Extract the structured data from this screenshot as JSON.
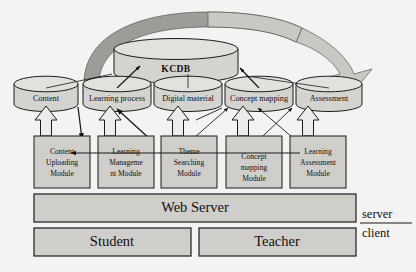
{
  "diagram": {
    "colors": {
      "background": "#f4f3f1",
      "cylinder_fill": "#d4d3cf",
      "cylinder_top_fill": "#e2e1de",
      "box_fill": "#cfcecb",
      "arrow_band_light": "#c9c8c4",
      "arrow_band_dark": "#9d9c98",
      "hollow_arrow_fill": "#edecea",
      "stroke": "#1b1b1b"
    },
    "central_db": {
      "label": "KCDB"
    },
    "databases": [
      {
        "label": "Content"
      },
      {
        "label": "Learning process"
      },
      {
        "label": "Digital material"
      },
      {
        "label": "Concept mapping"
      },
      {
        "label": "Assessment"
      }
    ],
    "modules": [
      {
        "lines": [
          "Content",
          "Uploading",
          "Module"
        ]
      },
      {
        "lines": [
          "Learning",
          "Manageme",
          "nt Module"
        ]
      },
      {
        "lines": [
          "Theme",
          "Searching",
          "Module"
        ]
      },
      {
        "lines": [
          "Concept",
          "mapping",
          "Module"
        ]
      },
      {
        "lines": [
          "Learning",
          "Assessment",
          "Module"
        ]
      }
    ],
    "layers": {
      "web_server": "Web Server",
      "student": "Student",
      "teacher": "Teacher"
    },
    "side_labels": {
      "server": "server",
      "client": "client"
    }
  }
}
